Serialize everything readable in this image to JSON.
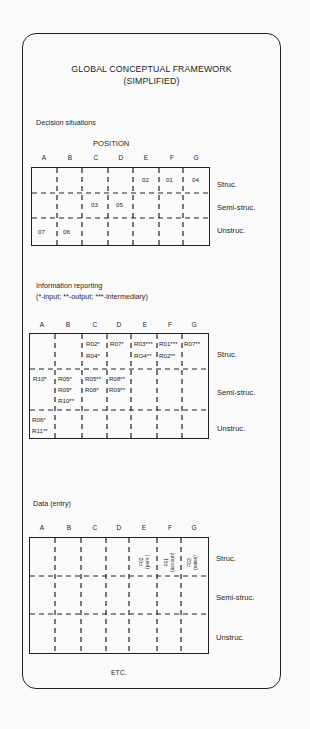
{
  "title": {
    "line1": "GLOBAL CONCEPTUAL FRAMEWORK",
    "line2": "(SIMPLIFIED)"
  },
  "columns": [
    "A",
    "B",
    "C",
    "D",
    "E",
    "F",
    "G"
  ],
  "rows": [
    "Struc.",
    "Semi-struc.",
    "Unstruc."
  ],
  "decision": {
    "label": "Decision situations",
    "position_label": "POSITION",
    "cells": [
      {
        "text": "02",
        "col": "E",
        "row": "Struc."
      },
      {
        "text": "01",
        "col": "F",
        "row": "Struc."
      },
      {
        "text": "04",
        "col": "G",
        "row": "Struc."
      },
      {
        "text": "03",
        "col": "C",
        "row": "Semi-struc."
      },
      {
        "text": "05",
        "col": "D",
        "row": "Semi-struc."
      },
      {
        "text": "07",
        "col": "A",
        "row": "Unstruc."
      },
      {
        "text": "06",
        "col": "B",
        "row": "Unstruc."
      }
    ]
  },
  "reporting": {
    "label": "Information reporting",
    "legend": "(*-input; **-output; ***-intermediary)",
    "cells": [
      {
        "text": "R02*",
        "col": "C",
        "row": "Struc."
      },
      {
        "text": "R04*",
        "col": "C",
        "row": "Struc."
      },
      {
        "text": "R07*",
        "col": "D",
        "row": "Struc."
      },
      {
        "text": "R03***",
        "col": "E",
        "row": "Struc."
      },
      {
        "text": "RO4**",
        "col": "E",
        "row": "Struc."
      },
      {
        "text": "R01***",
        "col": "F",
        "row": "Struc."
      },
      {
        "text": "R02**",
        "col": "F",
        "row": "Struc."
      },
      {
        "text": "R07**",
        "col": "G",
        "row": "Struc."
      },
      {
        "text": "R10*",
        "col": "A",
        "row": "Semi-struc."
      },
      {
        "text": "R05*",
        "col": "B",
        "row": "Semi-struc."
      },
      {
        "text": "R09*",
        "col": "B",
        "row": "Semi-struc."
      },
      {
        "text": "R10**",
        "col": "B",
        "row": "Semi-struc."
      },
      {
        "text": "R05**",
        "col": "C",
        "row": "Semi-struc."
      },
      {
        "text": "R08*",
        "col": "C",
        "row": "Semi-struc."
      },
      {
        "text": "R08**",
        "col": "D",
        "row": "Semi-struc."
      },
      {
        "text": "R09**",
        "col": "D",
        "row": "Semi-struc."
      },
      {
        "text": "R06*",
        "col": "A",
        "row": "Unstruc."
      },
      {
        "text": "R11**",
        "col": "A",
        "row": "Unstruc."
      }
    ]
  },
  "data_entry": {
    "label": "Data (entry)",
    "cells": [
      {
        "text": "F02",
        "sub": "(pers.)",
        "col": "E",
        "row": "Struc."
      },
      {
        "text": "F01",
        "sub": "(accoun)",
        "col": "F",
        "row": "Struc."
      },
      {
        "text": "F03",
        "sub": "(sales)",
        "col": "G",
        "row": "Struc."
      }
    ]
  },
  "footer": "ETC."
}
